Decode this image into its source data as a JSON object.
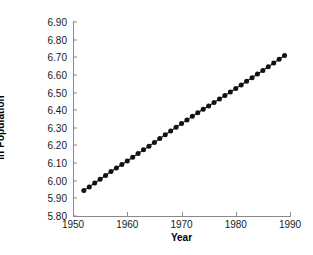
{
  "chart_data": {
    "type": "line",
    "title": "",
    "xlabel": "Year",
    "ylabel": "ln Population",
    "xlim": [
      1950,
      1990
    ],
    "ylim": [
      5.8,
      6.9
    ],
    "xticks": [
      1950,
      1960,
      1970,
      1980,
      1990
    ],
    "xtick_labels": [
      "1950",
      "1960",
      "1970",
      "1980",
      "1990"
    ],
    "yticks": [
      5.8,
      5.9,
      6.0,
      6.1,
      6.2,
      6.3,
      6.4,
      6.5,
      6.6,
      6.7,
      6.8,
      6.9
    ],
    "ytick_labels": [
      "5.80",
      "5.90",
      "6.00",
      "6.10",
      "6.20",
      "6.30",
      "6.40",
      "6.50",
      "6.60",
      "6.70",
      "6.80",
      "6.90"
    ],
    "grid": false,
    "legend": null,
    "marker": "filled-circle",
    "marker_color": "#111111",
    "line_color": "#111111",
    "spines": [
      "left",
      "bottom"
    ],
    "tick_direction": "in",
    "x": [
      1952,
      1953,
      1954,
      1955,
      1956,
      1957,
      1958,
      1959,
      1960,
      1961,
      1962,
      1963,
      1964,
      1965,
      1966,
      1967,
      1968,
      1969,
      1970,
      1971,
      1972,
      1973,
      1974,
      1975,
      1976,
      1977,
      1978,
      1979,
      1980,
      1981,
      1982,
      1983,
      1984,
      1985,
      1986,
      1987,
      1988,
      1989
    ],
    "values": [
      5.945,
      5.965,
      5.987,
      6.008,
      6.03,
      6.052,
      6.072,
      6.092,
      6.112,
      6.133,
      6.154,
      6.175,
      6.196,
      6.217,
      6.239,
      6.261,
      6.282,
      6.303,
      6.324,
      6.345,
      6.365,
      6.385,
      6.405,
      6.424,
      6.444,
      6.463,
      6.483,
      6.503,
      6.523,
      6.543,
      6.564,
      6.584,
      6.605,
      6.625,
      6.646,
      6.667,
      6.689,
      6.71
    ]
  }
}
